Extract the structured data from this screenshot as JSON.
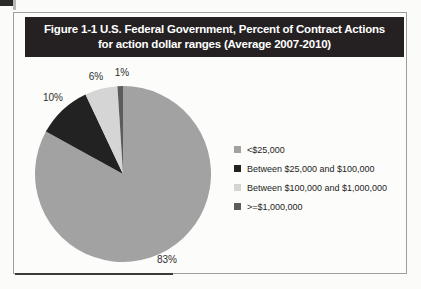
{
  "figure": {
    "title_line1": "Figure 1-1  U.S. Federal Government, Percent of Contract Actions",
    "title_line2": "for action dollar ranges (Average 2007-2010)",
    "title_bar_bg": "#252122",
    "title_color": "#ffffff",
    "frame_border_color": "#9e9e9e"
  },
  "chart_data": {
    "type": "pie",
    "title": "Figure 1-1 U.S. Federal Government, Percent of Contract Actions for action dollar ranges (Average 2007-2010)",
    "categories": [
      "<$25,000",
      "Between $25,000 and $100,000",
      "Between $100,000 and $1,000,000",
      ">=$1,000,000"
    ],
    "values": [
      83,
      10,
      6,
      1
    ],
    "display_labels": [
      "83%",
      "10%",
      "6%",
      "1%"
    ],
    "colors": [
      "#a2a2a2",
      "#222222",
      "#d5d5d5",
      "#5c5c5c"
    ],
    "start_angle_deg": 0,
    "direction": "clockwise",
    "legend_position": "right",
    "label_color": "#2e2e2e"
  }
}
